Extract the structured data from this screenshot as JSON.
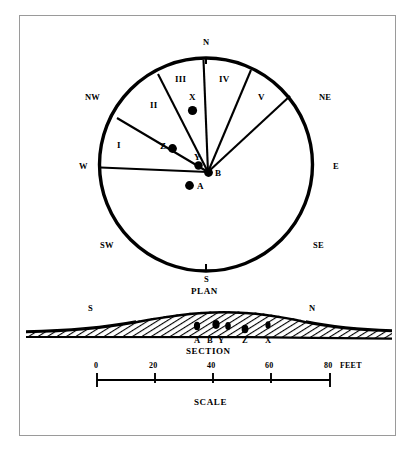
{
  "figure": {
    "title_plan": "PLAN",
    "title_section": "SECTION",
    "title_scale": "SCALE"
  },
  "plan": {
    "compass": [
      {
        "id": "n",
        "label": "N"
      },
      {
        "id": "ne",
        "label": "NE"
      },
      {
        "id": "e",
        "label": "E"
      },
      {
        "id": "se",
        "label": "SE"
      },
      {
        "id": "s",
        "label": "S"
      },
      {
        "id": "sw",
        "label": "SW"
      },
      {
        "id": "w",
        "label": "W"
      },
      {
        "id": "nw",
        "label": "NW"
      }
    ],
    "sectors": [
      {
        "id": "i",
        "label": "I"
      },
      {
        "id": "ii",
        "label": "II"
      },
      {
        "id": "iii",
        "label": "III"
      },
      {
        "id": "iv",
        "label": "IV"
      },
      {
        "id": "v",
        "label": "V"
      }
    ],
    "points": [
      {
        "id": "x",
        "label": "X"
      },
      {
        "id": "z",
        "label": "Z"
      },
      {
        "id": "y",
        "label": "Y"
      },
      {
        "id": "b",
        "label": "B"
      },
      {
        "id": "a",
        "label": "A"
      }
    ]
  },
  "section": {
    "end_left": "S",
    "end_right": "N",
    "points": [
      {
        "id": "a",
        "label": "A"
      },
      {
        "id": "b",
        "label": "B"
      },
      {
        "id": "y",
        "label": "Y"
      },
      {
        "id": "z",
        "label": "Z"
      },
      {
        "id": "x",
        "label": "X"
      }
    ]
  },
  "scale": {
    "ticks": [
      {
        "value": "0"
      },
      {
        "value": "20"
      },
      {
        "value": "40"
      },
      {
        "value": "60"
      },
      {
        "value": "80"
      }
    ],
    "units": "FEET"
  },
  "colors": {
    "ink": "#000000",
    "frame": "#9a9a9a",
    "paper": "#ffffff"
  }
}
